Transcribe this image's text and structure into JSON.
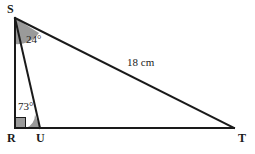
{
  "figure": {
    "background_color": "#ffffff",
    "stroke_color": "#1a1a1a",
    "angle_fill_color": "#9a9a9a",
    "vertices": {
      "S": {
        "label": "S",
        "x": 15,
        "y": 18,
        "label_x": 7,
        "label_y": 3
      },
      "R": {
        "label": "R",
        "x": 15,
        "y": 128,
        "label_x": 7,
        "label_y": 132
      },
      "U": {
        "label": "U",
        "x": 40,
        "y": 128,
        "label_x": 36,
        "label_y": 132
      },
      "T": {
        "label": "T",
        "x": 234,
        "y": 128,
        "label_x": 238,
        "label_y": 132
      }
    },
    "angles": [
      {
        "name": "angle-RSU",
        "at": "S",
        "value": "24°",
        "label_x": 26,
        "label_y": 34
      },
      {
        "name": "angle-SUR",
        "at": "U",
        "value": "73°",
        "label_x": 18,
        "label_y": 101
      },
      {
        "name": "angle-SRU",
        "at": "R",
        "value": "90°",
        "marker": "right-angle-square"
      }
    ],
    "sides": [
      {
        "name": "side-ST",
        "from": "S",
        "to": "T",
        "value": "18 cm",
        "label_x": 127,
        "label_y": 57
      }
    ]
  }
}
